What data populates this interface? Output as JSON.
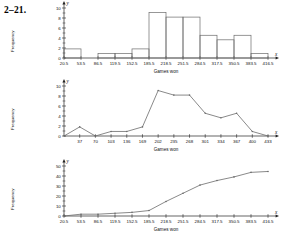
{
  "problem": {
    "number": "2–21."
  },
  "axis_titles": {
    "x": "Games won",
    "y": "Frequency",
    "x_letter": "x",
    "y_letter": "y"
  },
  "chart_data": [
    {
      "type": "bar",
      "title": "",
      "xlabel": "Games won",
      "ylabel": "Frequency",
      "categories": [
        "20.5",
        "53.5",
        "86.5",
        "119.5",
        "152.5",
        "185.5",
        "218.5",
        "251.5",
        "284.5",
        "317.5",
        "350.5",
        "383.5",
        "416.5"
      ],
      "boundaries": [
        20.5,
        53.5,
        86.5,
        119.5,
        152.5,
        185.5,
        218.5,
        251.5,
        284.5,
        317.5,
        350.5,
        383.5,
        416.5
      ],
      "values": [
        2,
        0,
        1,
        1,
        2,
        10,
        9,
        9,
        5,
        4,
        5,
        1
      ],
      "ylim": [
        0,
        11
      ],
      "yticks": [
        "0",
        "2",
        "4",
        "6",
        "8",
        "10"
      ],
      "ytick_values": [
        0,
        2,
        4,
        6,
        8,
        10
      ],
      "grid": false,
      "legend": "none"
    },
    {
      "type": "line",
      "title": "",
      "xlabel": "Games won",
      "ylabel": "Frequency",
      "x": [
        4,
        37,
        70,
        103,
        136,
        169,
        202,
        235,
        268,
        301,
        334,
        367,
        400,
        433
      ],
      "xticks": [
        "37",
        "70",
        "103",
        "136",
        "169",
        "202",
        "235",
        "268",
        "301",
        "334",
        "367",
        "400",
        "433"
      ],
      "xtick_values": [
        37,
        70,
        103,
        136,
        169,
        202,
        235,
        268,
        301,
        334,
        367,
        400,
        433
      ],
      "values": [
        0,
        2,
        0,
        1,
        1,
        2,
        10,
        9,
        9,
        5,
        4,
        5,
        1,
        0
      ],
      "ylim": [
        0,
        11
      ],
      "yticks": [
        "0",
        "2",
        "4",
        "6",
        "8",
        "10"
      ],
      "ytick_values": [
        0,
        2,
        4,
        6,
        8,
        10
      ],
      "grid": false,
      "legend": "none"
    },
    {
      "type": "line",
      "title": "",
      "xlabel": "Games won",
      "ylabel": "Frequency",
      "x": [
        20.5,
        53.5,
        86.5,
        119.5,
        152.5,
        185.5,
        218.5,
        251.5,
        284.5,
        317.5,
        350.5,
        383.5,
        416.5
      ],
      "xticks": [
        "20.5",
        "53.5",
        "86.5",
        "119.5",
        "152.5",
        "185.5",
        "218.5",
        "251.5",
        "284.5",
        "317.5",
        "350.5",
        "383.5",
        "416.5"
      ],
      "xtick_values": [
        20.5,
        53.5,
        86.5,
        119.5,
        152.5,
        185.5,
        218.5,
        251.5,
        284.5,
        317.5,
        350.5,
        383.5,
        416.5
      ],
      "values": [
        0,
        2,
        2,
        3,
        4,
        6,
        16,
        25,
        34,
        39,
        43,
        48,
        49
      ],
      "ylim": [
        0,
        55
      ],
      "yticks": [
        "0",
        "10",
        "20",
        "30",
        "40",
        "50"
      ],
      "ytick_values": [
        0,
        10,
        20,
        30,
        40,
        50
      ],
      "grid": false,
      "legend": "none"
    }
  ]
}
